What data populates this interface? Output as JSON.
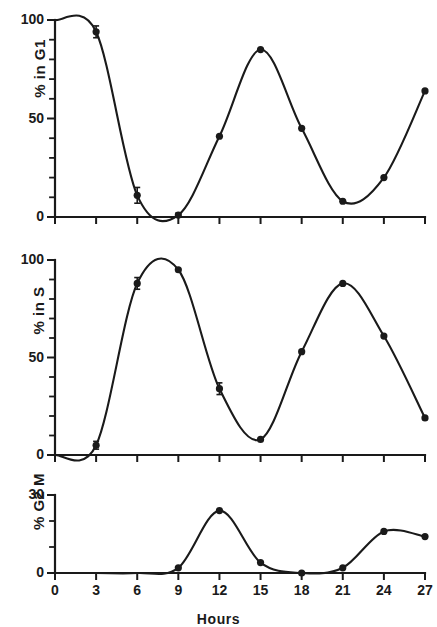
{
  "figure": {
    "xaxis_title": "Hours",
    "x_ticks": [
      "0",
      "3",
      "6",
      "9",
      "12",
      "15",
      "18",
      "21",
      "24",
      "27"
    ],
    "line_color": "#1a1a1a",
    "marker_color": "#1a1a1a"
  },
  "panels": {
    "g1": {
      "ylabel": "% in G1",
      "y_ticks": [
        "0",
        "50",
        "100"
      ]
    },
    "s": {
      "ylabel": "% in S",
      "y_ticks": [
        "0",
        "50",
        "100"
      ]
    },
    "g2m": {
      "ylabel": "% G2 M",
      "y_ticks": [
        "0",
        "30"
      ]
    }
  },
  "chart_data": [
    {
      "type": "line",
      "title": "",
      "xlabel": "Hours",
      "ylabel": "% in G1",
      "xlim": [
        0,
        27
      ],
      "ylim": [
        0,
        100
      ],
      "xticks": [
        0,
        3,
        6,
        9,
        12,
        15,
        18,
        21,
        24,
        27
      ],
      "yticks": [
        0,
        50,
        100
      ],
      "yminorticks": [
        10,
        20,
        30,
        40,
        60,
        70,
        80,
        90
      ],
      "grid": false,
      "legend": "none",
      "x": [
        0,
        3,
        6,
        9,
        12,
        15,
        18,
        21,
        24,
        27
      ],
      "values": [
        100,
        94,
        11,
        1,
        41,
        85,
        45,
        8,
        20,
        64
      ],
      "errors": [
        0,
        3,
        4,
        1,
        0,
        0,
        0,
        0,
        0,
        0
      ],
      "markers": true
    },
    {
      "type": "line",
      "title": "",
      "xlabel": "Hours",
      "ylabel": "% in S",
      "xlim": [
        0,
        27
      ],
      "ylim": [
        0,
        100
      ],
      "xticks": [
        0,
        3,
        6,
        9,
        12,
        15,
        18,
        21,
        24,
        27
      ],
      "yticks": [
        0,
        50,
        100
      ],
      "yminorticks": [
        10,
        20,
        30,
        40,
        60,
        70,
        80,
        90
      ],
      "grid": false,
      "legend": "none",
      "x": [
        0,
        3,
        6,
        9,
        12,
        15,
        18,
        21,
        24,
        27
      ],
      "values": [
        0,
        5,
        88,
        95,
        34,
        8,
        53,
        88,
        61,
        19
      ],
      "errors": [
        0,
        2,
        3,
        0,
        3,
        0,
        0,
        0,
        0,
        0
      ],
      "markers": true
    },
    {
      "type": "line",
      "title": "",
      "xlabel": "Hours",
      "ylabel": "% G2 M",
      "xlim": [
        0,
        27
      ],
      "ylim": [
        0,
        30
      ],
      "xticks": [
        0,
        3,
        6,
        9,
        12,
        15,
        18,
        21,
        24,
        27
      ],
      "yticks": [
        0,
        30
      ],
      "yminorticks": [
        10,
        20
      ],
      "grid": false,
      "legend": "none",
      "x": [
        0,
        3,
        6,
        9,
        12,
        15,
        18,
        21,
        24,
        27
      ],
      "values": [
        0,
        0,
        0,
        2,
        24,
        4,
        0,
        2,
        16,
        14
      ],
      "errors": [
        0,
        0,
        0,
        0,
        0,
        0,
        0,
        0,
        0,
        0
      ],
      "markers": true
    }
  ]
}
